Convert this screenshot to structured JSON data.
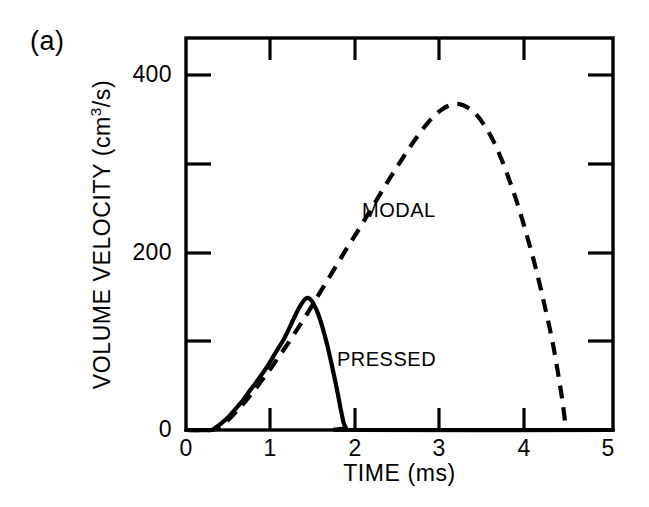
{
  "figure": {
    "panel_label": "(a)",
    "background_color": "#ffffff",
    "ink_color": "#000000"
  },
  "chart_data": {
    "type": "line",
    "title": "",
    "panel": "(a)",
    "xlabel": "TIME (ms)",
    "ylabel": "VOLUME VELOCITY (cm3/s)",
    "ylabel_parts": {
      "text": "VOLUME VELOCITY (cm",
      "sup": "3",
      "tail": "/s)"
    },
    "xlim": [
      0,
      5
    ],
    "ylim": [
      0,
      445
    ],
    "xticks": [
      0,
      1,
      2,
      3,
      4,
      5
    ],
    "xtick_labels": [
      "0",
      "1",
      "2",
      "3",
      "4",
      "5"
    ],
    "yticks": [
      0,
      100,
      200,
      300,
      400
    ],
    "ytick_labels": [
      "0",
      "",
      "200",
      "",
      "400"
    ],
    "ytick_labels_shown": [
      "0",
      "200",
      "400"
    ],
    "minor_yticks": [
      100,
      300
    ],
    "grid": false,
    "legend": "inline-annotations",
    "frame": "box",
    "tick_direction": "in",
    "series": [
      {
        "name": "MODAL",
        "style": "dashed",
        "label_text": "MODAL",
        "peak_time_ms": 3.2,
        "peak_value": 370,
        "onset_time_ms": 0.35,
        "offset_time_ms": 4.45,
        "x": [
          0.0,
          0.3,
          0.4,
          0.5,
          0.6,
          0.7,
          0.8,
          0.9,
          1.0,
          1.1,
          1.2,
          1.3,
          1.4,
          1.5,
          1.6,
          1.7,
          1.8,
          1.9,
          2.0,
          2.1,
          2.2,
          2.3,
          2.4,
          2.5,
          2.6,
          2.7,
          2.8,
          2.9,
          3.0,
          3.1,
          3.2,
          3.3,
          3.4,
          3.5,
          3.6,
          3.7,
          3.8,
          3.9,
          4.0,
          4.1,
          4.2,
          4.3,
          4.4,
          4.45
        ],
        "y": [
          0,
          0,
          4,
          12,
          22,
          33,
          45,
          58,
          71,
          85,
          99,
          114,
          129,
          145,
          161,
          177,
          193,
          209,
          224,
          240,
          256,
          272,
          288,
          303,
          318,
          332,
          345,
          356,
          364,
          369,
          370,
          366,
          358,
          345,
          328,
          306,
          280,
          251,
          218,
          182,
          141,
          96,
          38,
          0
        ]
      },
      {
        "name": "PRESSED",
        "style": "solid",
        "label_text": "PRESSED",
        "peak_time_ms": 1.42,
        "peak_value": 150,
        "onset_time_ms": 0.3,
        "offset_time_ms": 1.87,
        "x": [
          0.0,
          0.28,
          0.35,
          0.42,
          0.5,
          0.58,
          0.66,
          0.75,
          0.85,
          0.95,
          1.05,
          1.15,
          1.25,
          1.32,
          1.38,
          1.42,
          1.46,
          1.5,
          1.55,
          1.6,
          1.65,
          1.7,
          1.74,
          1.78,
          1.82,
          1.87,
          2.0,
          5.0
        ],
        "y": [
          0,
          0,
          3,
          8,
          15,
          24,
          33,
          45,
          58,
          72,
          88,
          104,
          124,
          138,
          147,
          150,
          148,
          142,
          131,
          116,
          98,
          77,
          59,
          40,
          20,
          3,
          0,
          0
        ]
      }
    ]
  },
  "annotations": [
    {
      "name": "modal-label",
      "text": "MODAL"
    },
    {
      "name": "pressed-label",
      "text": "PRESSED"
    }
  ]
}
